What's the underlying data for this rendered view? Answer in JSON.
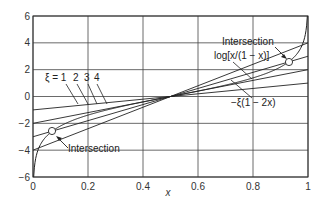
{
  "chart_data": {
    "type": "line",
    "title": "",
    "xlabel": "x",
    "ylabel": "",
    "xlim": [
      0,
      1
    ],
    "ylim": [
      -6,
      6
    ],
    "grid": true,
    "xticks": [
      "0",
      "0.2",
      "0.4",
      "0.6",
      "0.8",
      "1"
    ],
    "yticks": [
      "6",
      "4",
      "2",
      "0",
      "-2",
      "-4",
      "-6"
    ],
    "series": [
      {
        "name": "log[x/(1 - x)]",
        "function": "ln(x/(1-x))",
        "kind": "curve"
      },
      {
        "name": "ξ = 1",
        "function": "-1*(1-2x)",
        "x": [
          0,
          1
        ],
        "values": [
          -1,
          1
        ]
      },
      {
        "name": "ξ = 2",
        "function": "-2*(1-2x)",
        "x": [
          0,
          1
        ],
        "values": [
          -2,
          2
        ]
      },
      {
        "name": "ξ = 3",
        "function": "-3*(1-2x)",
        "x": [
          0,
          1
        ],
        "values": [
          -3,
          3
        ]
      },
      {
        "name": "ξ = 4",
        "function": "-4*(1-2x)",
        "x": [
          0,
          1
        ],
        "values": [
          -4,
          4
        ]
      }
    ],
    "points": [
      {
        "label": "Intersection",
        "x": 0.07,
        "y": -2.58
      },
      {
        "label": "Intersection",
        "x": 0.93,
        "y": 2.58
      }
    ],
    "annotations": {
      "xi_label": "ξ = 1",
      "xi_values": [
        "2",
        "3",
        "4"
      ],
      "log_label": "log[x/(1 − x)]",
      "line_label": "−ξ(1 − 2x)",
      "intersection_top": "Intersection",
      "intersection_bottom": "Intersection"
    }
  }
}
